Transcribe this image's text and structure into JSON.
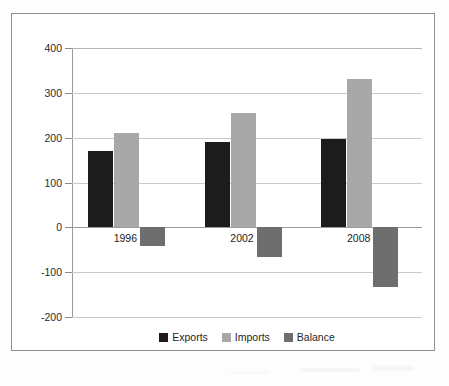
{
  "chart_data": {
    "type": "bar",
    "title": "",
    "subtitle": "",
    "xlabel": "",
    "ylabel": "",
    "categories": [
      "1996",
      "2002",
      "2008"
    ],
    "series": [
      {
        "name": "Exports",
        "color": "#1c1c1c",
        "values": [
          170,
          190,
          197
        ]
      },
      {
        "name": "Imports",
        "color": "#a8a8a8",
        "values": [
          211,
          256,
          331
        ]
      },
      {
        "name": "Balance",
        "color": "#6e6e6e",
        "values": [
          -42,
          -66,
          -133
        ]
      }
    ],
    "ylim": [
      -200,
      400
    ],
    "yticks": [
      400,
      300,
      200,
      100,
      0,
      -100,
      -200
    ],
    "ytick_labels": [
      "400",
      "300",
      "200",
      "100",
      "0",
      "-100",
      "-200"
    ],
    "grid": true,
    "legend_position": "bottom",
    "legend": [
      "Exports",
      "Imports",
      "Balance"
    ]
  },
  "colors": {
    "exports": "#1c1c1c",
    "imports": "#a8a8a8",
    "balance": "#6e6e6e",
    "grid": "#c9c9c9",
    "axis": "#9a9a9a",
    "frame": "#8e8e8e"
  }
}
